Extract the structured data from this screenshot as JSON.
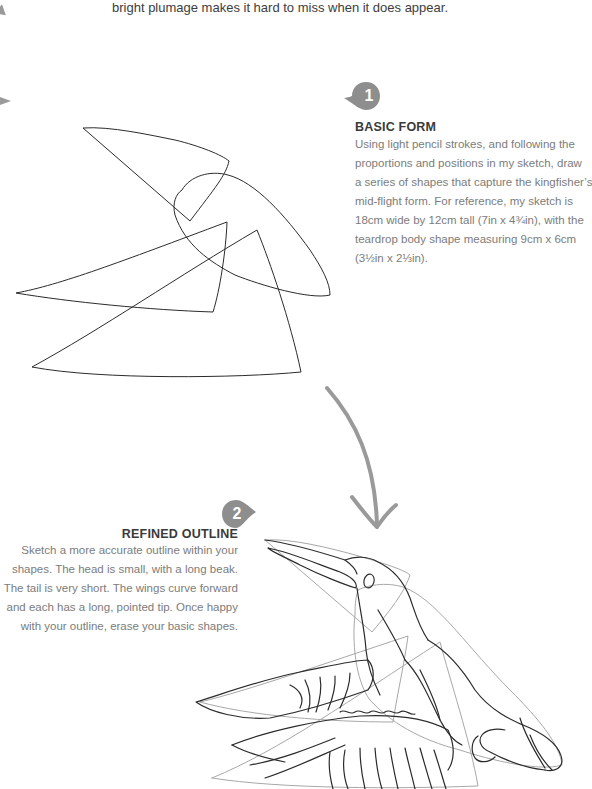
{
  "intro": {
    "text": "bright plumage makes it hard to miss when it does appear."
  },
  "steps": [
    {
      "number": "1",
      "title": "BASIC FORM",
      "lines": [
        "Using light pencil strokes, and following the",
        "proportions and positions in my sketch, draw",
        "a series of shapes that capture the kingfisher’s",
        "mid-flight form. For reference, my sketch is",
        "18cm wide by 12cm tall (7in x 4¾in), with the",
        "teardrop body shape measuring 9cm x 6cm",
        "(3½in x 2⅓in)."
      ]
    },
    {
      "number": "2",
      "title": "REFINED OUTLINE",
      "lines": [
        "Sketch a more accurate outline within your",
        "shapes. The head is small, with a long beak.",
        "The tail is very short. The wings curve forward",
        "and each has a long, pointed tip. Once happy",
        "with your outline, erase your basic shapes."
      ]
    }
  ],
  "illustrations": {
    "step1": "basic-shapes-sketch",
    "arrow": "curved-arrow-down",
    "step2": "kingfisher-refined-outline"
  },
  "colors": {
    "badge": "#8e8e8e",
    "arrow": "#9a9a9a",
    "ink": "#2b2b2b",
    "guide": "#a8a8a8"
  }
}
